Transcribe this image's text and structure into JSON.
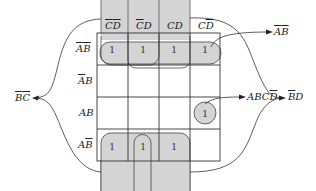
{
  "diagram": {
    "type": "karnaugh-map",
    "columns": [
      {
        "label": "C̄D̄",
        "bar": [
          "C",
          "D"
        ]
      },
      {
        "label": "C̄D",
        "bar": [
          "C"
        ]
      },
      {
        "label": "CD",
        "bar": []
      },
      {
        "label": "CD̄",
        "bar": [
          "D"
        ]
      }
    ],
    "rows": [
      {
        "label": "ĀB̄"
      },
      {
        "label": "ĀB"
      },
      {
        "label": "AB"
      },
      {
        "label": "AB̄"
      }
    ],
    "cells": [
      [
        "1",
        "1",
        "1",
        "1"
      ],
      [
        "",
        "",
        "",
        ""
      ],
      [
        "",
        "",
        "",
        "1"
      ],
      [
        "1",
        "1",
        "1",
        ""
      ]
    ],
    "groups": [
      {
        "term": "ĀB̄",
        "cells": "row 1 (all four cells)"
      },
      {
        "term": "ABCD̄",
        "cells": "row 3, column 4 (single cell)"
      },
      {
        "term": "B̄C̄",
        "cells": "columns 1-2, rows 1 and 4 (wrap-around)"
      },
      {
        "term": "B̄D",
        "cells": "columns 2-3, rows 1 and 4 (wrap-around)"
      }
    ],
    "shade_color": "#d4d4d4",
    "line_color": "#333333"
  }
}
